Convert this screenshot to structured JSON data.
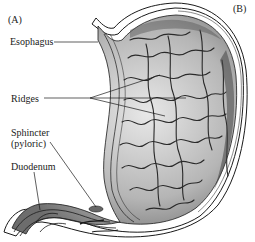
{
  "panels": {
    "left_tag": "(A)",
    "right_tag": "(B)"
  },
  "labels": {
    "esophagus": "Esophagus",
    "ridges": "Ridges",
    "sphincter_line1": "Sphincter",
    "sphincter_line2": "(pyloric)",
    "duodenum": "Duodenum"
  },
  "colors": {
    "ink": "#1a1a1a",
    "shade_dark": "#555555",
    "shade_mid": "#9a9a9a",
    "shade_light": "#d6d6d6",
    "background": "#ffffff"
  }
}
